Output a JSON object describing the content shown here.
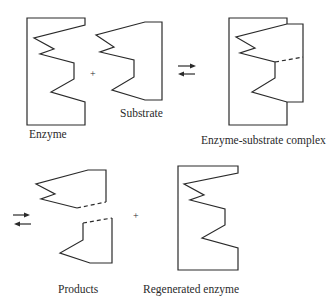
{
  "diagram": {
    "labels": {
      "enzyme": "Enzyme",
      "substrate": "Substrate",
      "complex": "Enzyme-substrate complex",
      "products": "Products",
      "regenerated": "Regenerated enzyme"
    },
    "operators": {
      "plus_top": "+",
      "plus_bottom": "+"
    },
    "arrows": {
      "top": "reversible-equilibrium",
      "bottom": "reversible-equilibrium"
    },
    "colors": {
      "stroke": "#2a2a2a",
      "background": "#ffffff"
    }
  }
}
